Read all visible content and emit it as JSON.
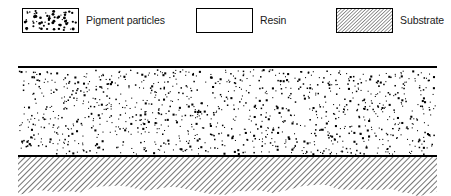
{
  "figure": {
    "background_color": "#ffffff",
    "line_color": "#000000",
    "width": 451,
    "height": 196
  },
  "legend": {
    "entries": [
      {
        "id": "pigment-particles",
        "label": "Pigment particles",
        "swatch": "dotted-rectangle",
        "swatch_fill": "#ffffff",
        "swatch_border": "#000000",
        "dot_color": "#000000",
        "x": 22,
        "label_x": 86
      },
      {
        "id": "resin",
        "label": "Resin",
        "swatch": "empty-rectangle",
        "swatch_fill": "#ffffff",
        "swatch_border": "#000000",
        "x": 196,
        "label_x": 258
      },
      {
        "id": "substrate",
        "label": "Substrate",
        "swatch": "hatched-rectangle",
        "swatch_fill": "#ffffff",
        "swatch_border": "#000000",
        "hatch_color": "#000000",
        "x": 336,
        "label_x": 398
      }
    ]
  },
  "diagram": {
    "coating_layer": {
      "name": "coating-layer",
      "description": "Resin matrix filled with dispersed pigment particles",
      "left": 18,
      "right": 437,
      "top": 27,
      "bottom": 116,
      "fill": "#ffffff",
      "particle_color": "#000000",
      "particle_count": 1150
    },
    "top_surface_line": {
      "name": "coating-top-surface",
      "y": 27,
      "thickness": 2.2,
      "color": "#000000"
    },
    "interface_line": {
      "name": "coating-substrate-interface",
      "y": 116,
      "thickness": 2.2,
      "color": "#000000"
    },
    "substrate_layer": {
      "name": "substrate-layer",
      "description": "Hatched substrate with irregular torn lower edge",
      "left": 18,
      "right": 437,
      "top": 117,
      "bottom": 150,
      "hatch_color": "#000000",
      "hatch_angle_deg": 45,
      "edge_style": "torn"
    }
  }
}
